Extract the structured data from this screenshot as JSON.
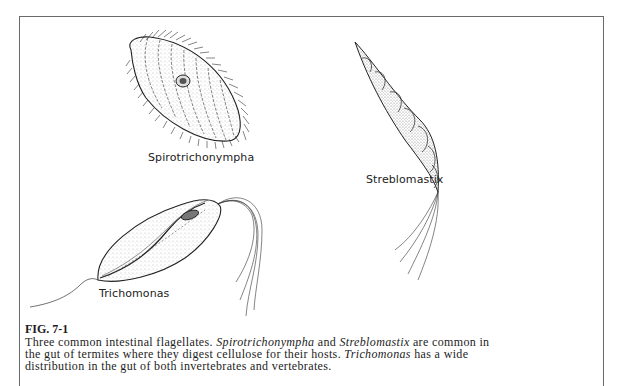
{
  "figure": {
    "number": "FIG. 7-1",
    "caption_parts": [
      {
        "text": "Three common intestinal flagellates. ",
        "italic": false
      },
      {
        "text": "Spirotrichonympha",
        "italic": true
      },
      {
        "text": " and ",
        "italic": false
      },
      {
        "text": "Streblomastix",
        "italic": true
      },
      {
        "text": " are common in the gut of termites where they digest cellulose for their hosts. ",
        "italic": false
      },
      {
        "text": "Trichomonas",
        "italic": true
      },
      {
        "text": " has a wide distribution in the gut of both invertebrates and vertebrates.",
        "italic": false
      }
    ],
    "labels": {
      "spirotrichonympha": "Spirotrichonympha",
      "streblomastix": "Streblomastix",
      "trichomonas": "Trichomonas"
    }
  },
  "colors": {
    "ink": "#1d1d1d",
    "frame": "#6a6a6a",
    "stipple": "#888888"
  }
}
